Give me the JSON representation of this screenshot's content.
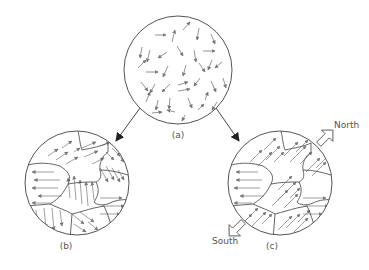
{
  "figure": {
    "panels": [
      {
        "id": "a",
        "label": "(a)",
        "description": "random dipole orientation"
      },
      {
        "id": "b",
        "label": "(b)",
        "description": "domains with aligned dipoles, randomly oriented"
      },
      {
        "id": "c",
        "label": "(c)",
        "description": "domains aligned by external field"
      }
    ],
    "poles": {
      "north": "North",
      "south": "South"
    },
    "colors": {
      "stroke": "#555555",
      "arrow": "#777777",
      "background": "#ffffff"
    }
  }
}
